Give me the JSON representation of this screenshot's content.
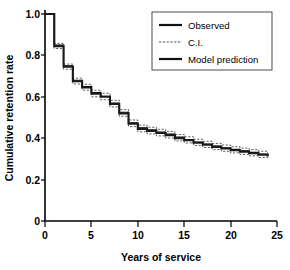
{
  "figure": {
    "background_color": "#ffffff",
    "line_color": "#1a1a1a"
  },
  "legend": {
    "position": "top-right",
    "entries": [
      {
        "label": "Observed",
        "style": "solid"
      },
      {
        "label": "C.I.",
        "style": "dashed"
      },
      {
        "label": "Model prediction",
        "style": "solid-thick"
      }
    ]
  },
  "axes": {
    "x_label": "Years of service",
    "y_label": "Cumulative retention rate",
    "x_ticks": [
      "0",
      "5",
      "10",
      "15",
      "20",
      "25"
    ],
    "y_ticks": [
      "0",
      "0.2",
      "0.4",
      "0.6",
      "0.8",
      "1.0"
    ]
  },
  "chart_data": {
    "type": "line",
    "title": "",
    "subtitle": "",
    "xlabel": "Years of service",
    "ylabel": "Cumulative retention rate",
    "xlim": [
      0,
      25
    ],
    "ylim": [
      0,
      1.0
    ],
    "xticks": [
      0,
      5,
      10,
      15,
      20,
      25
    ],
    "yticks": [
      0,
      0.2,
      0.4,
      0.6,
      0.8,
      1.0
    ],
    "grid": false,
    "legend_position": "top-right",
    "step_style": "post",
    "annotations": [],
    "series": [
      {
        "name": "Observed",
        "style": "solid",
        "x": [
          0,
          1,
          2,
          3,
          4,
          5,
          6,
          7,
          8,
          9,
          10,
          11,
          12,
          13,
          14,
          15,
          16,
          17,
          18,
          19,
          20,
          21,
          22,
          23,
          24
        ],
        "values": [
          1.0,
          0.845,
          0.745,
          0.675,
          0.645,
          0.615,
          0.6,
          0.565,
          0.52,
          0.47,
          0.445,
          0.435,
          0.425,
          0.415,
          0.4,
          0.39,
          0.378,
          0.368,
          0.358,
          0.35,
          0.342,
          0.335,
          0.328,
          0.32,
          0.312
        ]
      },
      {
        "name": "Model prediction",
        "style": "solid-thick",
        "x": [
          0,
          1,
          2,
          3,
          4,
          5,
          6,
          7,
          8,
          9,
          10,
          11,
          12,
          13,
          14,
          15,
          16,
          17,
          18,
          19,
          20,
          21,
          22,
          23,
          24
        ],
        "values": [
          1.0,
          0.85,
          0.75,
          0.68,
          0.65,
          0.62,
          0.603,
          0.57,
          0.525,
          0.475,
          0.45,
          0.44,
          0.43,
          0.42,
          0.405,
          0.394,
          0.382,
          0.372,
          0.362,
          0.354,
          0.346,
          0.339,
          0.332,
          0.324,
          0.316
        ]
      },
      {
        "name": "C.I. upper",
        "style": "dashed",
        "x": [
          0,
          1,
          2,
          3,
          4,
          5,
          6,
          7,
          8,
          9,
          10,
          11,
          12,
          13,
          14,
          15,
          16,
          17,
          18,
          19,
          20,
          21,
          22,
          23,
          24
        ],
        "values": [
          1.0,
          0.858,
          0.758,
          0.69,
          0.66,
          0.632,
          0.617,
          0.583,
          0.538,
          0.488,
          0.463,
          0.453,
          0.443,
          0.433,
          0.418,
          0.407,
          0.395,
          0.385,
          0.375,
          0.367,
          0.359,
          0.352,
          0.345,
          0.337,
          0.329
        ]
      },
      {
        "name": "C.I. lower",
        "style": "dashed",
        "x": [
          0,
          1,
          2,
          3,
          4,
          5,
          6,
          7,
          8,
          9,
          10,
          11,
          12,
          13,
          14,
          15,
          16,
          17,
          18,
          19,
          20,
          21,
          22,
          23,
          24
        ],
        "values": [
          1.0,
          0.833,
          0.733,
          0.662,
          0.632,
          0.6,
          0.586,
          0.551,
          0.506,
          0.456,
          0.431,
          0.421,
          0.411,
          0.401,
          0.387,
          0.377,
          0.365,
          0.355,
          0.345,
          0.337,
          0.329,
          0.322,
          0.315,
          0.307,
          0.299
        ]
      }
    ]
  }
}
